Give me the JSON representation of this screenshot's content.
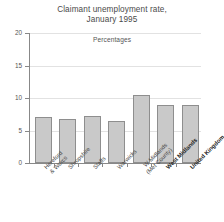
{
  "chart_data": {
    "type": "bar",
    "title": "Claimant unemployment rate, January 1995",
    "title_lines": [
      "Claimant unemployment rate,",
      "January 1995"
    ],
    "subtitle": "Percentages",
    "xlabel": "",
    "ylabel": "",
    "ylim": [
      0,
      20
    ],
    "yticks": [
      0,
      5,
      10,
      15,
      20
    ],
    "ytick_labels": [
      "0",
      "5",
      "10",
      "15",
      "20"
    ],
    "grid": true,
    "legend": "none",
    "categories": [
      "Hereford & Worcs",
      "Shropshire",
      "Staffs",
      "Warwicks",
      "W Midlands (Met County)",
      "West Midlands",
      "United Kingdom"
    ],
    "category_lines": [
      [
        "Hereford",
        "& Worcs"
      ],
      [
        "Shropshire"
      ],
      [
        "Staffs"
      ],
      [
        "Warwicks"
      ],
      [
        "W Midlands",
        "(Met County)"
      ],
      [
        "West Midlands"
      ],
      [
        "United Kingdom"
      ]
    ],
    "category_emphasis": [
      false,
      false,
      false,
      false,
      false,
      true,
      true
    ],
    "values": [
      7.1,
      6.8,
      7.3,
      6.5,
      10.4,
      8.9,
      8.9
    ],
    "bar_color": "#c9c9c9",
    "bar_edge_color": "#8e8e8e",
    "axis_color": "#888888",
    "grid_color": "#e2e2e2",
    "text_color": "#4a4a4a"
  }
}
